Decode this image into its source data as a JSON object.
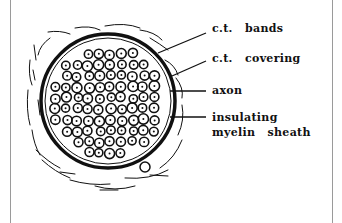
{
  "diagram": {
    "type": "cross-section",
    "labels": [
      {
        "id": "ct-bands",
        "text": "c.t.   bands"
      },
      {
        "id": "ct-covering",
        "text": "c.t.   covering"
      },
      {
        "id": "axon",
        "text": "axon"
      },
      {
        "id": "myelin-line1",
        "text": "insulating"
      },
      {
        "id": "myelin-line2",
        "text": "myelin   sheath"
      }
    ]
  },
  "colors": {
    "ink": "#111111",
    "background": "#ffffff",
    "frame": "#9a9a9a"
  }
}
